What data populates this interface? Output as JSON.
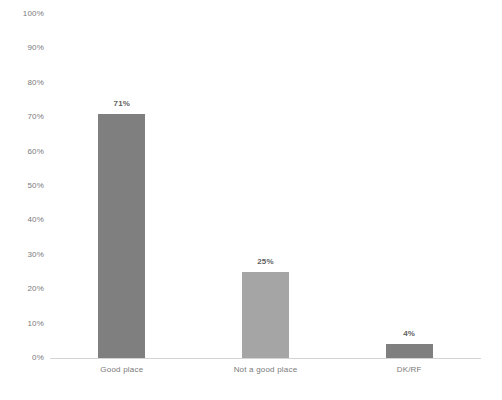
{
  "chart_data": {
    "type": "bar",
    "title": "",
    "subtitle": "",
    "xlabel": "",
    "ylabel": "",
    "categories": [
      "Good place",
      "Not a good place",
      "DK/RF"
    ],
    "values": [
      71,
      25,
      4
    ],
    "value_labels": [
      "71%",
      "25%",
      "4%"
    ],
    "bar_colors": [
      "#7f7f7f",
      "#a5a5a5",
      "#7f7f7f"
    ],
    "ylim": [
      0,
      100
    ],
    "ytick_values": [
      0,
      10,
      20,
      30,
      40,
      50,
      60,
      70,
      80,
      90,
      100
    ],
    "ytick_labels": [
      "0%",
      "10%",
      "20%",
      "30%",
      "40%",
      "50%",
      "60%",
      "70%",
      "80%",
      "90%",
      "100%"
    ],
    "grid": false,
    "legend": "none",
    "axis_color": "#d4d4d4",
    "tick_label_color": "#7a7a7a",
    "value_label_color": "#5f5f5f",
    "background": "#ffffff"
  }
}
